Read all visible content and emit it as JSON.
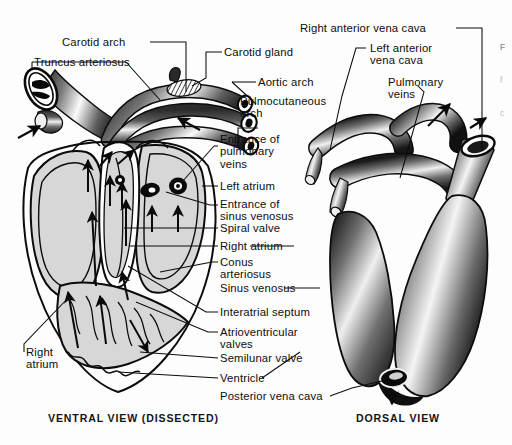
{
  "figure": {
    "background_color": "#fdfdfd",
    "ink_color": "#0d0d0d",
    "tissue_fill": "#d7d7d7",
    "views": [
      {
        "id": "ventral",
        "caption": "VENTRAL VIEW (DISSECTED)"
      },
      {
        "id": "dorsal",
        "caption": "DORSAL VIEW"
      }
    ],
    "edge_caption": {
      "line1": "F",
      "line2": "f",
      "line3": "c"
    }
  },
  "labels": {
    "ventral": [
      {
        "key": "carotid_arch",
        "text": "Carotid arch"
      },
      {
        "key": "truncus_arteriosus",
        "text": "Truncus arteriosus"
      },
      {
        "key": "carotid_gland",
        "text": "Carotid gland"
      },
      {
        "key": "aortic_arch",
        "text": "Aortic arch"
      },
      {
        "key": "pulmocutaneous_arch",
        "text": "Pulmocutaneous\narch"
      },
      {
        "key": "entrance_pulmonary_veins",
        "text": "Entrance of\npulmonary\nveins"
      },
      {
        "key": "left_atrium",
        "text": "Left atrium"
      },
      {
        "key": "entrance_sinus_venosus",
        "text": "Entrance of\nsinus venosus"
      },
      {
        "key": "spiral_valve",
        "text": "Spiral valve"
      },
      {
        "key": "right_atrium_mid",
        "text": "Right atrium"
      },
      {
        "key": "conus_arteriosus",
        "text": "Conus\narteriosus"
      },
      {
        "key": "sinus_venosus",
        "text": "Sinus venosus"
      },
      {
        "key": "interatrial_septum",
        "text": "Interatrial septum"
      },
      {
        "key": "atrioventricular_valves",
        "text": "Atrioventricular\nvalves"
      },
      {
        "key": "semilunar_valve",
        "text": "Semilunar valve"
      },
      {
        "key": "ventricle",
        "text": "Ventricle"
      },
      {
        "key": "posterior_vena_cava",
        "text": "Posterior vena cava"
      },
      {
        "key": "right_atrium_left",
        "text": "Right\natrium"
      }
    ],
    "dorsal": [
      {
        "key": "right_anterior_vena_cava",
        "text": "Right anterior vena cava"
      },
      {
        "key": "left_anterior_vena_cava",
        "text": "Left anterior\nvena cava"
      },
      {
        "key": "pulmonary_veins",
        "text": "Pulmonary\nveins"
      }
    ]
  }
}
